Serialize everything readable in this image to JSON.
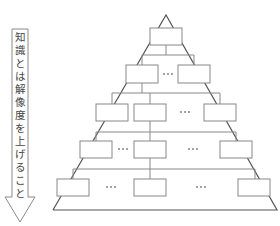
{
  "caption": {
    "text": "",
    "clipped": true
  },
  "arrow": {
    "label": "知識とは解像度を上げること",
    "direction": "down",
    "stroke": "#888888"
  },
  "pyramid": {
    "outline_color": "#555555",
    "box_color": "#888888",
    "ellipsis": "・・・",
    "levels": [
      {
        "level": 1,
        "boxes": 1,
        "ellipses": 0
      },
      {
        "level": 2,
        "boxes": 2,
        "ellipses": 1
      },
      {
        "level": 3,
        "boxes": 3,
        "ellipses": 1
      },
      {
        "level": 4,
        "boxes": 3,
        "ellipses": 2
      },
      {
        "level": 5,
        "boxes": 3,
        "ellipses": 2
      }
    ]
  }
}
